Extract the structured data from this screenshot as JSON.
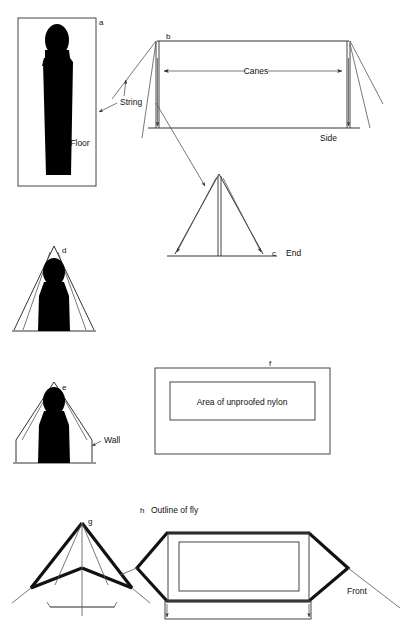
{
  "figure": {
    "background_color": "#ffffff",
    "line_color": "#333333",
    "thick_line_color": "#111111",
    "silhouette_color": "#000000"
  },
  "labels": {
    "a": "a",
    "b": "b",
    "c": "c",
    "d": "d",
    "e": "e",
    "f": "f",
    "g": "g",
    "h": "h",
    "floor": "Floor",
    "string": "String",
    "canes": "Canes",
    "side": "Side",
    "end": "End",
    "wall": "Wall",
    "unproofed_nylon": "Area of unproofed nylon",
    "outline_of_fly": "Outline of fly",
    "front": "Front"
  },
  "panels": [
    {
      "key": "a",
      "letter": "a",
      "name": "floor-plan",
      "caption": "Floor",
      "description": "Rectangular groundsheet plan with reclining figure silhouette"
    },
    {
      "key": "b",
      "letter": "b",
      "name": "side-elevation",
      "caption": "Side",
      "description": "Side elevation showing two vertical canes with guy lines and span dimension",
      "dimension_label": "Canes"
    },
    {
      "key": "c",
      "letter": "c",
      "name": "end-elevation",
      "caption": "End",
      "description": "Triangular end elevation with central vertical cane"
    },
    {
      "key": "d",
      "letter": "d",
      "name": "end-section-no-wall",
      "caption": "",
      "description": "End section with seated figure, plain triangular profile"
    },
    {
      "key": "e",
      "letter": "e",
      "name": "end-section-with-wall",
      "caption": "Wall",
      "description": "End section with seated figure and vertical side walls"
    },
    {
      "key": "f",
      "letter": "f",
      "name": "fabric-panel",
      "caption": "Area of unproofed nylon",
      "description": "Flat fabric panel showing central area of unproofed nylon"
    },
    {
      "key": "g",
      "letter": "g",
      "name": "perspective-frame",
      "caption": "",
      "description": "Three-quarter perspective of pitched tent with fly ridge lines and guys"
    },
    {
      "key": "h",
      "letter": "h",
      "name": "fly-plan",
      "caption": "Outline of fly",
      "description": "Plan of flysheet outline with inner tent rectangle",
      "extra_caption": "Front"
    }
  ]
}
